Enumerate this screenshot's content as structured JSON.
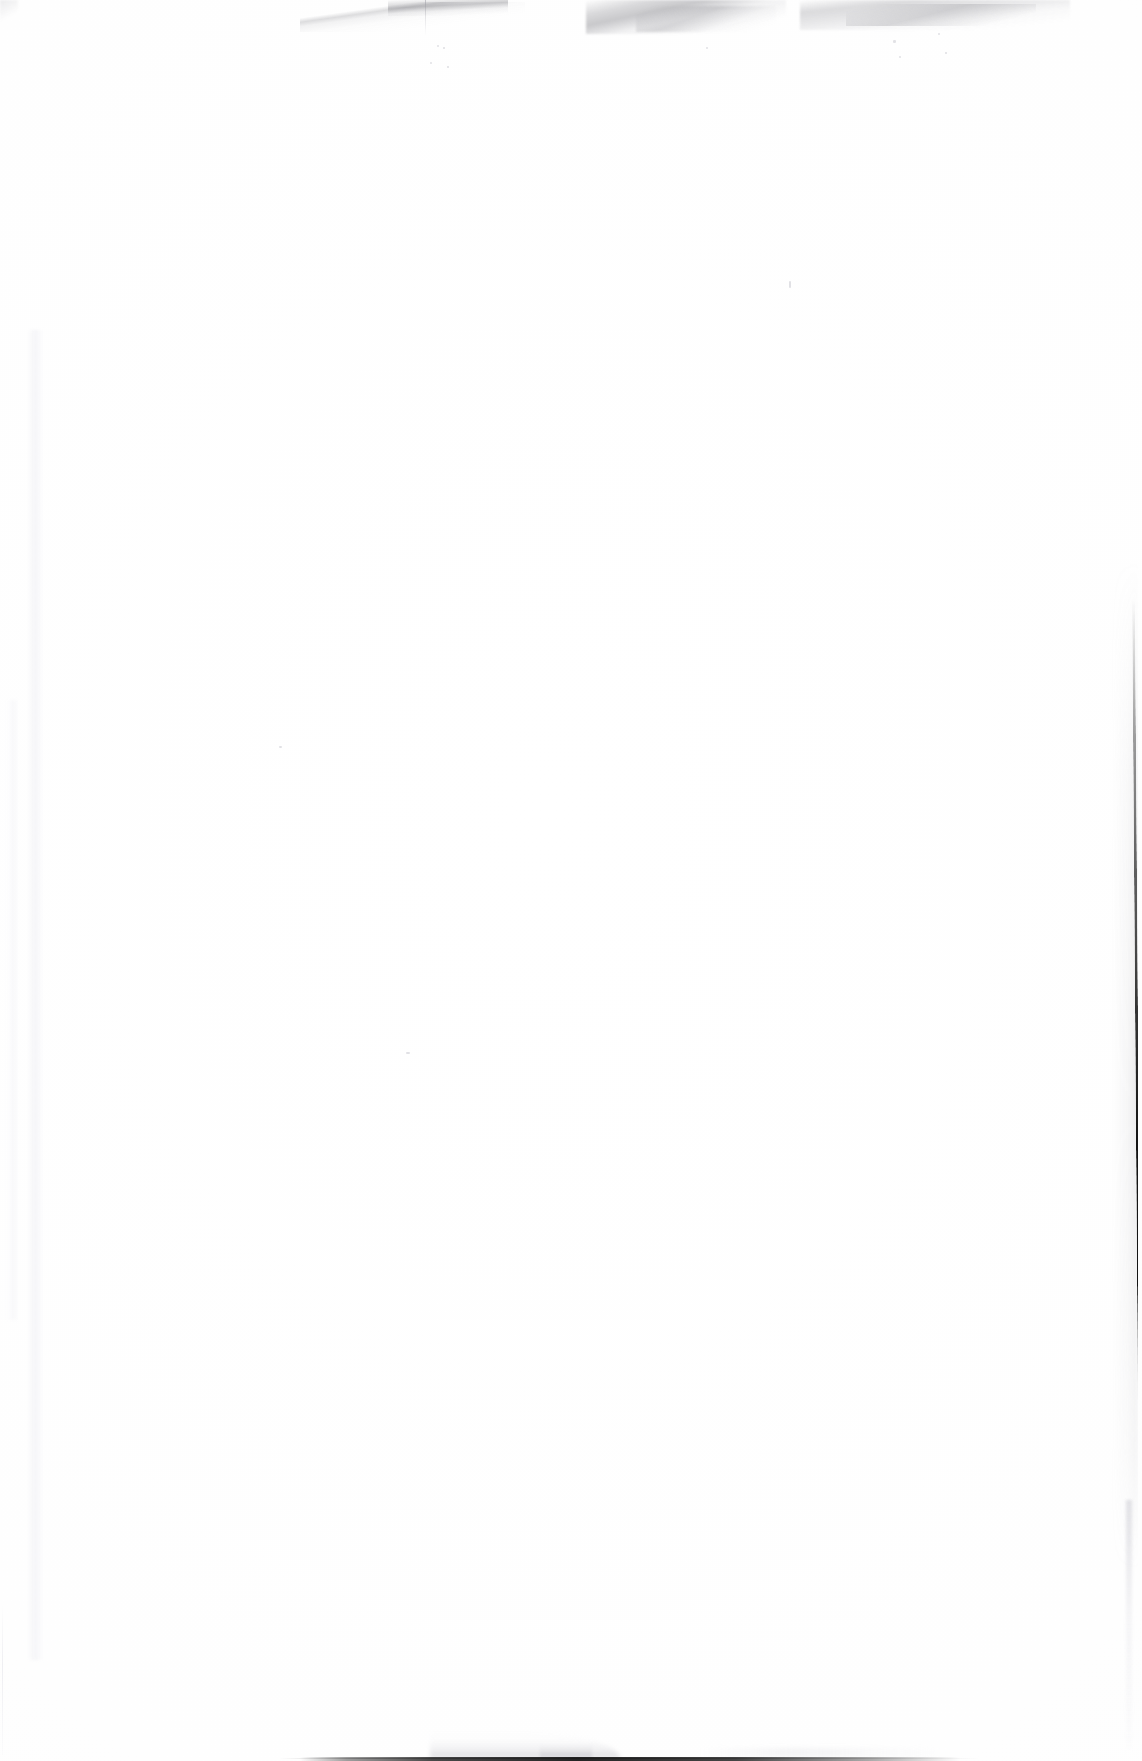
{
  "document": {
    "kind": "scanned-blank-page",
    "page_content_text": "",
    "visible_text": [],
    "width_px": 1142,
    "height_px": 1761
  },
  "colors": {
    "paper": "#fefefe",
    "paper_edge_shadow": "#fcfcfc",
    "edge_line_dark": "#141414",
    "bottom_line_dark": "#1a1a1a",
    "wisp_gray": "#6c6c73",
    "faint_gray": "#e9e9ee"
  },
  "artifacts": {
    "top_edge": {
      "name": "torn-paper-edge-streaks",
      "clusters": [
        {
          "id": "cluster-a",
          "x": 300,
          "y": 0,
          "width": 225,
          "height": 30
        },
        {
          "id": "cluster-b",
          "x": 586,
          "y": 0,
          "width": 200,
          "height": 34
        },
        {
          "id": "cluster-c",
          "x": 800,
          "y": 0,
          "width": 270,
          "height": 30
        }
      ],
      "vertical_tick": {
        "x": 425,
        "y_start": 0,
        "y_end": 36
      }
    },
    "right_edge": {
      "name": "page-edge-dark-line",
      "x": 1133,
      "y_start": 620,
      "y_peak_start": 1150,
      "y_peak_end": 1480,
      "y_end": 1520,
      "thickness_px": 3,
      "lean": "slightly-left-descending"
    },
    "bottom_edge": {
      "name": "page-bottom-shadow-line",
      "x_start": 310,
      "x_end": 950,
      "thickness_px": 3,
      "lifted_paper_wedge": {
        "x_start": 450,
        "x_end": 600
      }
    },
    "left_edge": {
      "name": "faint-vertical-streak",
      "x_start": 28,
      "x_end": 42
    }
  }
}
